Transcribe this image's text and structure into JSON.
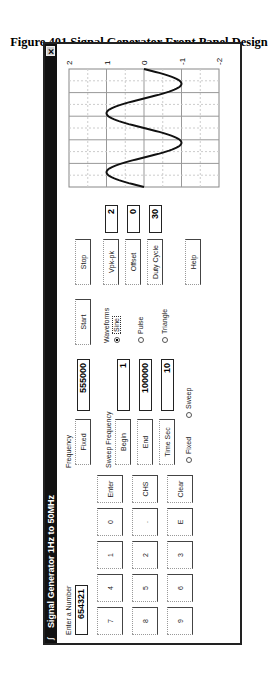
{
  "caption": "Figure 401 Signal Generator Front Panel Design",
  "window": {
    "title": "Signal Generator 1Hz to 50MHz",
    "close_icon": "close-icon",
    "app_icon": "signal-generator-icon"
  },
  "entry": {
    "label": "Enter a Number",
    "value": "654321"
  },
  "keypad": {
    "rows": [
      [
        "7",
        "8",
        "9"
      ],
      [
        "4",
        "5",
        "6"
      ],
      [
        "1",
        "2",
        "3"
      ],
      [
        "0",
        ".",
        "E"
      ],
      [
        "Enter",
        "CHS",
        "Clear"
      ]
    ]
  },
  "frequency": {
    "label": "Frequency",
    "fixed_button": "Fixed",
    "fixed_value": "555000"
  },
  "sweep": {
    "label": "Sweep Frequency",
    "begin_button": "Begin",
    "begin_value": "1",
    "end_button": "End",
    "end_value": "100000",
    "time_button": "Time Sec",
    "time_value": "10",
    "mode_fixed": "Fixed",
    "mode_sweep": "Sweep"
  },
  "controls": {
    "start": "Start",
    "stop": "Stop",
    "help": "Help"
  },
  "waveforms": {
    "label": "Waveforms",
    "options": [
      "Sine",
      "Pulse",
      "Triangle"
    ],
    "selected": "Sine"
  },
  "params": {
    "vpk_label": "Vpk-pk",
    "vpk_value": "2",
    "offset_label": "Offset",
    "offset_value": "0",
    "duty_label": "Duty Cycle",
    "duty_value": "30"
  },
  "chart_data": {
    "type": "line",
    "title": "",
    "xlabel": "",
    "ylabel": "",
    "ylim": [
      -2,
      2
    ],
    "yticks": [
      "2",
      "1",
      "0",
      "-1",
      "-2"
    ],
    "grid": true,
    "series": [
      {
        "name": "Sine waveform",
        "description": "sine wave, amplitude 1, offset 0, approx 2 cycles across display",
        "x": [
          0,
          0.25,
          0.5,
          0.75,
          1.0,
          1.25,
          1.5,
          1.75,
          2.0
        ],
        "values": [
          0,
          1,
          0,
          -1,
          0,
          1,
          0,
          -1,
          0
        ]
      }
    ]
  }
}
